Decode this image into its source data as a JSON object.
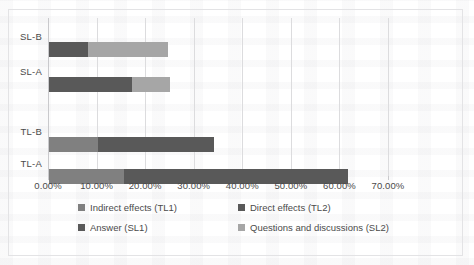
{
  "chart_data": {
    "type": "bar",
    "orientation": "horizontal",
    "stacked": true,
    "title": "",
    "xlabel": "",
    "ylabel": "",
    "categories": [
      "TL-A",
      "TL-B",
      "SL-A",
      "SL-B"
    ],
    "categories_top_to_bottom": [
      "SL-B",
      "SL-A",
      "TL-B",
      "TL-A"
    ],
    "xlim": [
      0,
      70
    ],
    "xticks": [
      0,
      10,
      20,
      30,
      40,
      50,
      60,
      70
    ],
    "xtick_labels": [
      "0.00%",
      "10.00%",
      "20.00%",
      "30.00%",
      "40.00%",
      "50.00%",
      "60.00%",
      "70.00%"
    ],
    "grid": true,
    "legend_position": "bottom",
    "series": [
      {
        "name": "Indirect effects (TL1)",
        "color": "#808080",
        "values": [
          15.5,
          10.0,
          0,
          0
        ]
      },
      {
        "name": "Direct effects (TL2)",
        "color": "#595959",
        "values": [
          46.0,
          24.0,
          0,
          0
        ]
      },
      {
        "name": "Answer (SL1)",
        "color": "#595959",
        "values": [
          0,
          0,
          17.0,
          8.0
        ]
      },
      {
        "name": "Questions and discussions (SL2)",
        "color": "#a6a6a6",
        "values": [
          0,
          0,
          8.0,
          16.5
        ]
      }
    ],
    "totals": [
      61.5,
      34.0,
      25.0,
      24.5
    ]
  },
  "axis": {
    "tick_labels": [
      "0.00%",
      "10.00%",
      "20.00%",
      "30.00%",
      "40.00%",
      "50.00%",
      "60.00%",
      "70.00%"
    ],
    "category_labels": [
      "SL-B",
      "SL-A",
      "TL-B",
      "TL-A"
    ]
  },
  "legend": {
    "items": [
      {
        "label": "Indirect effects (TL1)",
        "color": "#808080"
      },
      {
        "label": "Direct effects (TL2)",
        "color": "#595959"
      },
      {
        "label": "Answer (SL1)",
        "color": "#595959"
      },
      {
        "label": "Questions and discussions (SL2)",
        "color": "#a6a6a6"
      }
    ]
  },
  "colors": {
    "tl1": "#808080",
    "tl2": "#595959",
    "sl1": "#595959",
    "sl2": "#a6a6a6",
    "grid": "#dcdcde",
    "frame": "#e3e3e5",
    "text": "#4a4a4a"
  }
}
